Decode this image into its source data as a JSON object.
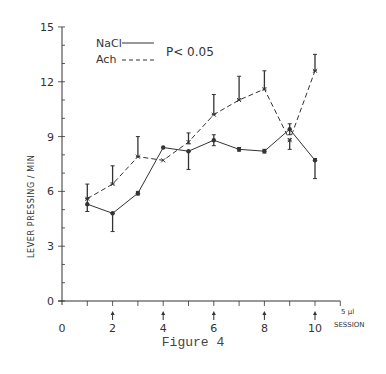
{
  "chart_data": {
    "type": "line",
    "title": "",
    "caption": "Figure 4",
    "xlabel": "SESSION",
    "xlabel_note": "5 µl",
    "ylabel": "LEVER PRESSING / MIN",
    "xlim": [
      0,
      11
    ],
    "ylim": [
      0,
      15
    ],
    "x_ticks": [
      0,
      1,
      2,
      3,
      4,
      5,
      6,
      7,
      8,
      9,
      10,
      11
    ],
    "x_tick_labels": [
      "0",
      "2",
      "4",
      "6",
      "8",
      "10"
    ],
    "x_tick_label_positions": [
      0,
      2,
      4,
      6,
      8,
      10
    ],
    "y_tick_labels": [
      "0",
      "3",
      "6",
      "9",
      "12",
      "15"
    ],
    "y_tick_label_positions": [
      0,
      3,
      6,
      9,
      12,
      15
    ],
    "y_minor_ticks_step": 1,
    "injection_arrows_at": [
      2,
      4,
      6,
      8,
      10
    ],
    "grid": false,
    "legend": {
      "position": "top-left",
      "entries": [
        {
          "name": "NaCl",
          "style": "solid"
        },
        {
          "name": "Ach",
          "style": "dashed"
        }
      ]
    },
    "annotations": [
      "P< 0.05"
    ],
    "x": [
      1,
      2,
      3,
      4,
      5,
      6,
      7,
      8,
      9,
      10
    ],
    "series": [
      {
        "name": "NaCl",
        "style": "solid",
        "marker": "dot",
        "values": [
          5.3,
          4.8,
          5.9,
          8.4,
          8.2,
          8.8,
          8.3,
          8.2,
          9.4,
          7.7
        ],
        "err_low": [
          4.9,
          3.8,
          5.8,
          8.4,
          7.2,
          8.5,
          8.2,
          8.1,
          9.1,
          6.7
        ],
        "err_high": [
          5.6,
          4.8,
          6.0,
          8.4,
          8.2,
          9.1,
          8.4,
          8.3,
          9.7,
          7.8
        ]
      },
      {
        "name": "Ach",
        "style": "dashed",
        "marker": "x",
        "values": [
          5.6,
          6.4,
          7.9,
          7.7,
          8.7,
          10.2,
          11.0,
          11.6,
          8.8,
          12.6
        ],
        "err_low": [
          5.6,
          6.4,
          7.9,
          7.7,
          8.6,
          10.2,
          11.0,
          11.6,
          8.3,
          12.6
        ],
        "err_high": [
          6.4,
          7.4,
          9.0,
          7.7,
          9.2,
          11.3,
          12.3,
          12.6,
          8.8,
          13.5
        ]
      }
    ]
  },
  "labels": {
    "caption": "Figure 4",
    "session": "SESSION",
    "dose": "5 µl",
    "ylabel": "LEVER PRESSING / MIN",
    "legend_nacl": "NaCl",
    "legend_ach": "Ach",
    "pvalue": "P< 0.05"
  },
  "colors": {
    "ink": "#333333",
    "background": "#ffffff"
  }
}
